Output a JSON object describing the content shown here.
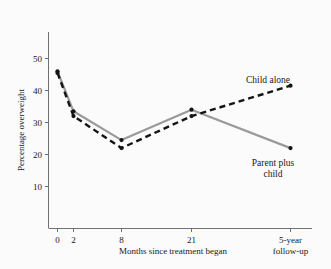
{
  "chart_data": {
    "type": "line",
    "title": "",
    "xlabel": "Months since treatment began",
    "ylabel": "Percentage overweight",
    "x_tick_labels": [
      "0",
      "2",
      "8",
      "21",
      "5-year\nfollow-up"
    ],
    "x_tick_label_line1": [
      "0",
      "2",
      "8",
      "21",
      "5-year"
    ],
    "x_tick_label_line2": [
      "",
      "",
      "",
      "",
      "follow-up"
    ],
    "x_positions": [
      0,
      2,
      8,
      21,
      60
    ],
    "y_ticks": [
      10,
      20,
      30,
      40,
      50
    ],
    "y_tick_labels": [
      "10",
      "20",
      "30",
      "40",
      "50"
    ],
    "ylim": [
      0,
      56
    ],
    "xlim": [
      -3,
      66
    ],
    "grid": false,
    "legend_position": "inline-annotations",
    "categories": [
      "0",
      "2",
      "8",
      "21",
      "5-year follow-up"
    ],
    "series": [
      {
        "name": "Parent plus child",
        "label_line1": "Parent plus",
        "label_line2": "child",
        "style": "solid",
        "color": "#9a9a9a",
        "marker_color": "#141414",
        "values": [
          46,
          33.5,
          24.5,
          34,
          22
        ]
      },
      {
        "name": "Child alone",
        "label_line1": "Child alone",
        "label_line2": "",
        "style": "dashed",
        "color": "#141414",
        "marker_color": "#141414",
        "values": [
          45.5,
          32,
          22,
          32,
          41.5
        ]
      }
    ],
    "colors": {
      "background": "#fbfbfb",
      "axis": "#6f7073",
      "text": "#18181a",
      "series_parent_plus_child": "#9a9a9a",
      "series_child_alone": "#141414"
    }
  }
}
